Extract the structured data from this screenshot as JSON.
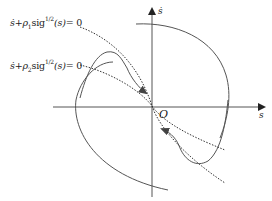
{
  "diagram": {
    "title": "",
    "axes": {
      "horizontal_label": "s",
      "vertical_label": "ṡ",
      "origin_label": "O"
    },
    "equations": [
      {
        "id": "surface-1",
        "lhs_var": "ṡ",
        "plus": "+",
        "coef": "ρ",
        "coef_sub": "1",
        "fn": "sig",
        "exp_num": "1",
        "exp_den": "2",
        "arg": "(s)",
        "rhs": "= 0",
        "text": "ṡ+ρ1sig^(1/2)(s)=0"
      },
      {
        "id": "surface-2",
        "lhs_var": "ṡ",
        "plus": "+",
        "coef": "ρ",
        "coef_sub": "2",
        "fn": "sig",
        "exp_num": "1",
        "exp_den": "2",
        "arg": "(s)",
        "rhs": "= 0",
        "text": "ṡ+ρ2sig^(1/2)(s)=0"
      }
    ],
    "elements": [
      "horizontal s-axis with arrow",
      "vertical ṡ-axis with arrow",
      "outer closed solid trajectory",
      "inner solid trajectory with arrowheads converging to origin",
      "two dotted curves through origin (sliding surfaces)"
    ],
    "colors": {
      "line": "#555555",
      "dotted": "#333333",
      "text": "#222222"
    }
  }
}
